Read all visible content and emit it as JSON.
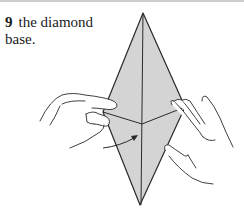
{
  "step": {
    "number": "9",
    "text_line1": "the diamond",
    "text_line2": "base."
  },
  "figure": {
    "paper_fill": "#d4d4d4",
    "line_color": "#2a2a2a"
  }
}
